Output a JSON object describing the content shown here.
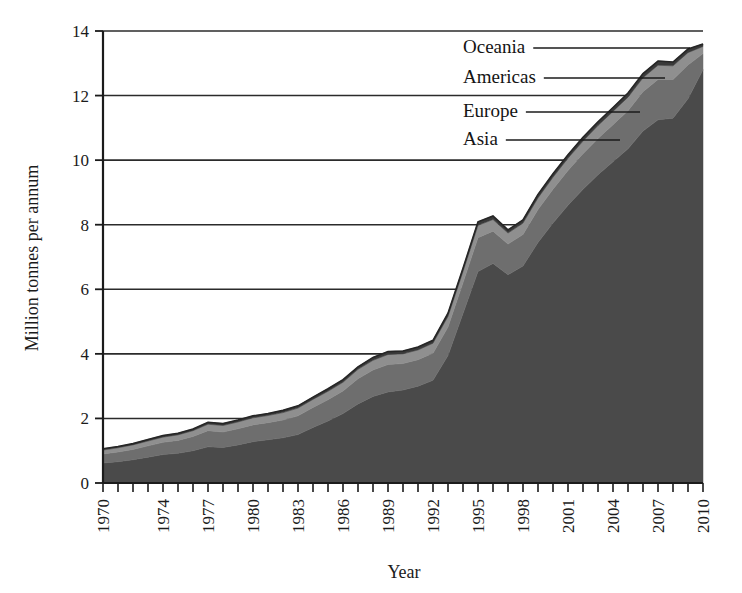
{
  "chart_data": {
    "type": "area",
    "stacked": true,
    "title": "",
    "xlabel": "Year",
    "ylabel": "Million tonnes per annum",
    "xlim": [
      1970,
      2010
    ],
    "ylim": [
      0,
      14
    ],
    "yticks": [
      0,
      2,
      4,
      6,
      8,
      10,
      12,
      14
    ],
    "ytick_labels": [
      "0",
      "2",
      "4",
      "6",
      "8",
      "10",
      "12",
      "14"
    ],
    "grid": true,
    "grid_axis": "y",
    "legend_position": "inside-upper-right-with-leader-lines",
    "x": [
      1970,
      1971,
      1972,
      1973,
      1974,
      1975,
      1976,
      1977,
      1978,
      1979,
      1980,
      1981,
      1982,
      1983,
      1984,
      1985,
      1986,
      1987,
      1988,
      1989,
      1990,
      1991,
      1992,
      1993,
      1994,
      1995,
      1996,
      1997,
      1998,
      1999,
      2000,
      2001,
      2002,
      2003,
      2004,
      2005,
      2006,
      2007,
      2008,
      2009,
      2010
    ],
    "xtick_labels": [
      "1970",
      "1974",
      "1977",
      "1980",
      "1983",
      "1986",
      "1989",
      "1992",
      "1995",
      "1998",
      "2001",
      "2004",
      "2007",
      "2010"
    ],
    "xtick_values": [
      1970,
      1974,
      1977,
      1980,
      1983,
      1986,
      1989,
      1992,
      1995,
      1998,
      2001,
      2004,
      2007,
      2010
    ],
    "series": [
      {
        "name": "Asia",
        "color": "#4a4a4a",
        "values": [
          0.62,
          0.66,
          0.72,
          0.8,
          0.88,
          0.92,
          1.0,
          1.12,
          1.1,
          1.18,
          1.28,
          1.34,
          1.4,
          1.5,
          1.72,
          1.92,
          2.15,
          2.45,
          2.68,
          2.82,
          2.88,
          3.0,
          3.18,
          3.95,
          5.25,
          6.55,
          6.8,
          6.45,
          6.72,
          7.45,
          8.05,
          8.6,
          9.1,
          9.55,
          9.95,
          10.35,
          10.9,
          11.25,
          11.3,
          11.9,
          12.8
        ]
      },
      {
        "name": "Europe",
        "color": "#6e6e6e",
        "values": [
          0.28,
          0.3,
          0.32,
          0.35,
          0.38,
          0.4,
          0.44,
          0.5,
          0.48,
          0.5,
          0.52,
          0.53,
          0.55,
          0.58,
          0.62,
          0.66,
          0.7,
          0.78,
          0.82,
          0.85,
          0.82,
          0.82,
          0.84,
          0.88,
          0.95,
          1.05,
          1.0,
          0.95,
          0.98,
          1.02,
          1.05,
          1.08,
          1.1,
          1.12,
          1.15,
          1.18,
          1.22,
          1.25,
          1.2,
          1.05,
          0.5
        ]
      },
      {
        "name": "Americas",
        "color": "#8f8f8f",
        "values": [
          0.12,
          0.13,
          0.14,
          0.15,
          0.16,
          0.17,
          0.18,
          0.2,
          0.2,
          0.21,
          0.22,
          0.22,
          0.23,
          0.24,
          0.25,
          0.26,
          0.27,
          0.29,
          0.3,
          0.31,
          0.3,
          0.3,
          0.31,
          0.33,
          0.35,
          0.38,
          0.36,
          0.34,
          0.35,
          0.36,
          0.37,
          0.38,
          0.39,
          0.4,
          0.41,
          0.42,
          0.43,
          0.44,
          0.42,
          0.38,
          0.22
        ]
      },
      {
        "name": "Oceania",
        "color": "#3a3a3a",
        "values": [
          0.04,
          0.04,
          0.04,
          0.05,
          0.05,
          0.05,
          0.05,
          0.06,
          0.06,
          0.06,
          0.06,
          0.06,
          0.07,
          0.07,
          0.07,
          0.08,
          0.08,
          0.08,
          0.09,
          0.09,
          0.09,
          0.09,
          0.09,
          0.1,
          0.1,
          0.11,
          0.11,
          0.1,
          0.1,
          0.11,
          0.11,
          0.11,
          0.12,
          0.12,
          0.12,
          0.13,
          0.13,
          0.13,
          0.12,
          0.11,
          0.08
        ]
      }
    ],
    "totals": [
      1.06,
      1.13,
      1.22,
      1.35,
      1.47,
      1.54,
      1.67,
      1.88,
      1.84,
      1.95,
      2.08,
      2.15,
      2.25,
      2.39,
      2.66,
      2.92,
      3.2,
      3.6,
      3.89,
      4.07,
      4.09,
      4.21,
      4.42,
      5.26,
      6.65,
      8.09,
      8.27,
      7.84,
      8.15,
      8.94,
      9.58,
      10.17,
      10.71,
      11.19,
      11.63,
      12.08,
      12.68,
      13.07,
      13.04,
      13.44,
      13.6
    ]
  },
  "legend": {
    "items": [
      {
        "label": "Oceania"
      },
      {
        "label": "Americas"
      },
      {
        "label": "Europe"
      },
      {
        "label": "Asia"
      }
    ]
  },
  "axes": {
    "y_title": "Million tonnes per annum",
    "x_title": "Year"
  }
}
